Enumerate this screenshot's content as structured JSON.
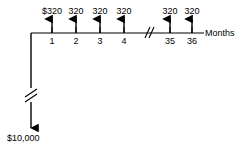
{
  "diagram": {
    "type": "cash-flow-diagram",
    "axis_title": "Months",
    "stroke_color": "#000000",
    "background_color": "#ffffff",
    "timeline": {
      "start_x": 31,
      "end_x": 204,
      "y": 33,
      "break_x": 148,
      "break_label": "axis-break"
    },
    "outflow": {
      "label": "$10,000",
      "amount": 10000,
      "direction": "down",
      "x": 31,
      "from_y": 33,
      "to_y": 129,
      "break_y": 95
    },
    "inflows": [
      {
        "label": "$320",
        "amount": 320,
        "period": "1",
        "x": 52,
        "direction": "up"
      },
      {
        "label": "320",
        "amount": 320,
        "period": "2",
        "x": 76,
        "direction": "up"
      },
      {
        "label": "320",
        "amount": 320,
        "period": "3",
        "x": 100,
        "direction": "up"
      },
      {
        "label": "320",
        "amount": 320,
        "period": "4",
        "x": 124,
        "direction": "up"
      },
      {
        "label": "320",
        "amount": 320,
        "period": "35",
        "x": 170,
        "direction": "up"
      },
      {
        "label": "320",
        "amount": 320,
        "period": "36",
        "x": 192,
        "direction": "up"
      }
    ]
  }
}
